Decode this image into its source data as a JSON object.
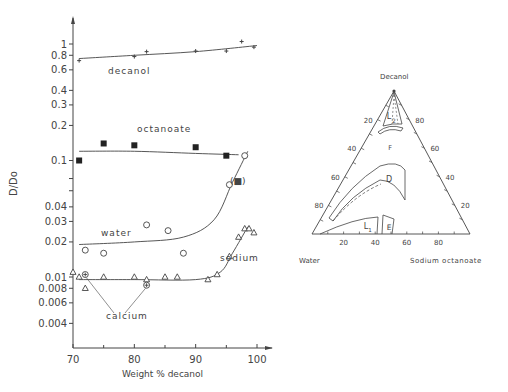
{
  "chart_data": [
    {
      "type": "scatter",
      "title": "",
      "xlabel": "Weight % decanol",
      "ylabel": "D/Do",
      "xlim": [
        70,
        103
      ],
      "ylim": [
        0.003,
        1.5
      ],
      "yscale": "log",
      "grid": false,
      "legend_position": "inline labels",
      "x_ticks": [
        70,
        80,
        90,
        100
      ],
      "y_ticks": [
        1,
        0.8,
        0.6,
        0.4,
        0.3,
        0.2,
        0.1,
        0.04,
        0.03,
        0.02,
        0.01,
        0.008,
        0.006,
        0.004
      ],
      "series": [
        {
          "name": "decanol",
          "marker": "plus",
          "points": [
            [
              71,
              0.72
            ],
            [
              80,
              0.78
            ],
            [
              82,
              0.86
            ],
            [
              90,
              0.87
            ],
            [
              95,
              0.87
            ],
            [
              97.5,
              1.05
            ],
            [
              99.5,
              0.94
            ]
          ],
          "fit_curve": [
            [
              71,
              0.75
            ],
            [
              80,
              0.8
            ],
            [
              90,
              0.86
            ],
            [
              100,
              0.97
            ]
          ]
        },
        {
          "name": "octanoate",
          "marker": "filled-square",
          "points": [
            [
              71,
              0.1
            ],
            [
              75,
              0.14
            ],
            [
              80,
              0.135
            ],
            [
              90,
              0.13
            ],
            [
              95,
              0.11
            ]
          ],
          "fit_curve": [
            [
              71,
              0.12
            ],
            [
              80,
              0.12
            ],
            [
              90,
              0.115
            ],
            [
              97,
              0.112
            ]
          ],
          "annotation": {
            "text": "(■)",
            "x": 100,
            "y": 0.095
          }
        },
        {
          "name": "water",
          "marker": "open-circle",
          "points": [
            [
              72,
              0.017
            ],
            [
              75,
              0.016
            ],
            [
              82,
              0.028
            ],
            [
              85.5,
              0.025
            ],
            [
              88,
              0.016
            ],
            [
              95.5,
              0.062
            ],
            [
              98,
              0.11
            ]
          ],
          "fit_curve": [
            [
              71,
              0.019
            ],
            [
              80,
              0.02
            ],
            [
              88,
              0.022
            ],
            [
              93,
              0.031
            ],
            [
              96,
              0.065
            ],
            [
              98.5,
              0.12
            ]
          ]
        },
        {
          "name": "sodium",
          "marker": "open-triangle",
          "points": [
            [
              70,
              0.011
            ],
            [
              71,
              0.01
            ],
            [
              72,
              0.008
            ],
            [
              75,
              0.01
            ],
            [
              80,
              0.01
            ],
            [
              82,
              0.0095
            ],
            [
              85,
              0.01
            ],
            [
              87,
              0.01
            ],
            [
              92,
              0.0095
            ],
            [
              93.5,
              0.0105
            ],
            [
              95.5,
              0.015
            ],
            [
              97,
              0.022
            ],
            [
              98,
              0.026
            ],
            [
              98.7,
              0.026
            ],
            [
              99.5,
              0.024
            ]
          ],
          "fit_curve": [
            [
              71,
              0.0095
            ],
            [
              80,
              0.0095
            ],
            [
              90,
              0.0095
            ],
            [
              94,
              0.011
            ],
            [
              96,
              0.016
            ],
            [
              98.5,
              0.027
            ]
          ]
        },
        {
          "name": "calcium",
          "marker": "circled-cross",
          "points": [
            [
              72,
              0.0105
            ],
            [
              82,
              0.0085
            ]
          ]
        }
      ]
    },
    {
      "type": "ternary",
      "title": "",
      "vertices": {
        "top": "Decanol",
        "left": "Water",
        "right": "Sodium octanoate"
      },
      "left_axis_ticks": [
        20,
        40,
        60,
        80
      ],
      "right_axis_ticks": [
        80,
        60,
        40,
        20
      ],
      "bottom_axis_ticks": [
        20,
        40,
        60,
        80
      ],
      "regions": [
        "L2",
        "F",
        "D",
        "L1",
        "E"
      ]
    }
  ],
  "left_chart": {
    "ylabel": "D/Do",
    "xlabel": "Weight % decanol",
    "y_ticks": [
      {
        "label": "1",
        "v": 1
      },
      {
        "label": "0.8",
        "v": 0.8
      },
      {
        "label": "0.6",
        "v": 0.6
      },
      {
        "label": "0.4",
        "v": 0.4
      },
      {
        "label": "0.3",
        "v": 0.3
      },
      {
        "label": "0.2",
        "v": 0.2
      },
      {
        "label": "0.1",
        "v": 0.1
      },
      {
        "label": "0.04",
        "v": 0.04
      },
      {
        "label": "0.03",
        "v": 0.03
      },
      {
        "label": "0.02",
        "v": 0.02
      },
      {
        "label": "0.01",
        "v": 0.01
      },
      {
        "label": "0.008",
        "v": 0.008
      },
      {
        "label": "0.006",
        "v": 0.006
      },
      {
        "label": "0.004",
        "v": 0.004
      }
    ],
    "x_ticks": [
      {
        "label": "70",
        "v": 70
      },
      {
        "label": "80",
        "v": 80
      },
      {
        "label": "90",
        "v": 90
      },
      {
        "label": "100",
        "v": 100
      }
    ],
    "series_labels": {
      "decanol": "decanol",
      "octanoate": "octanoate",
      "water": "water",
      "sodium": "sodium",
      "calcium": "calcium",
      "octanoate_paren": "(■)"
    }
  },
  "ternary": {
    "top_label": "Decanol",
    "left_label": "Water",
    "right_label": "Sodium octanoate",
    "left_ticks": [
      "20",
      "40",
      "60",
      "80"
    ],
    "right_ticks": [
      "80",
      "60",
      "40",
      "20"
    ],
    "bottom_ticks": [
      "20",
      "40",
      "60",
      "80"
    ],
    "regions": {
      "L2": "L",
      "L2_sub": "2",
      "F": "F",
      "D": "D",
      "L1": "L",
      "L1_sub": "1",
      "E": "E"
    }
  },
  "colors": {
    "ink": "#444444",
    "background": "#ffffff"
  }
}
